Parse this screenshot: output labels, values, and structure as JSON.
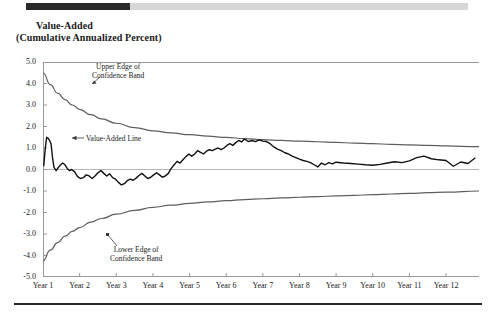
{
  "header": {
    "progress_fill_percent": 23.5,
    "bar_color": "#2b2b2b",
    "track_color": "#d7d7d7"
  },
  "title": {
    "line1": "Value-Added",
    "line2": "(Cumulative Annualized Percent)"
  },
  "annotations": {
    "upper_line1": "Upper Edge of",
    "upper_line2": "Confidence Band",
    "lower_line1": "Lower Edge of",
    "lower_line2": "Confidence Band",
    "value_line": "Value-Added Line"
  },
  "colors": {
    "value_line": "#111111",
    "band": "#5e5e5e",
    "axis": "#9a9a9a",
    "zero_line": "#b5b5b5",
    "text": "#1a1a1a"
  },
  "chart_data": {
    "type": "line",
    "title": "Value-Added (Cumulative Annualized Percent)",
    "xlabel": "",
    "ylabel": "",
    "ylim": [
      -5.0,
      5.0
    ],
    "xlim": [
      1,
      12.9
    ],
    "grid": false,
    "legend_position": "annotated-inline",
    "y_ticks": [
      "5.0",
      "4.0",
      "3.0",
      "2.0",
      "1.0",
      "0.0",
      "-1.0",
      "-2.0",
      "-3.0",
      "-4.0",
      "-5.0"
    ],
    "y_tick_values": [
      5.0,
      4.0,
      3.0,
      2.0,
      1.0,
      0.0,
      -1.0,
      -2.0,
      -3.0,
      -4.0,
      -5.0
    ],
    "x_ticks": [
      "Year 1",
      "Year 2",
      "Year 3",
      "Year 4",
      "Year 5",
      "Year 6",
      "Year 7",
      "Year 8",
      "Year 9",
      "Year 10",
      "Year 11",
      "Year 12"
    ],
    "x_tick_values": [
      1,
      2,
      3,
      4,
      5,
      6,
      7,
      8,
      9,
      10,
      11,
      12
    ],
    "series": [
      {
        "name": "Upper Edge of Confidence Band",
        "style": "smooth-decay",
        "x": [
          1.0,
          1.2,
          1.4,
          1.6,
          1.8,
          2.0,
          2.3,
          2.6,
          3.0,
          3.5,
          4.0,
          4.5,
          5.0,
          5.5,
          6.0,
          6.5,
          7.0,
          7.5,
          8.0,
          8.5,
          9.0,
          9.5,
          10.0,
          10.5,
          11.0,
          11.5,
          12.0,
          12.9
        ],
        "values": [
          4.5,
          3.95,
          3.55,
          3.25,
          3.0,
          2.8,
          2.55,
          2.35,
          2.15,
          1.95,
          1.8,
          1.7,
          1.62,
          1.55,
          1.49,
          1.44,
          1.39,
          1.35,
          1.32,
          1.29,
          1.26,
          1.23,
          1.2,
          1.17,
          1.15,
          1.12,
          1.1,
          1.06
        ]
      },
      {
        "name": "Lower Edge of Confidence Band",
        "style": "smooth-decay",
        "x": [
          1.0,
          1.2,
          1.4,
          1.6,
          1.8,
          2.0,
          2.3,
          2.6,
          3.0,
          3.5,
          4.0,
          4.5,
          5.0,
          5.5,
          6.0,
          6.5,
          7.0,
          7.5,
          8.0,
          8.5,
          9.0,
          9.5,
          10.0,
          10.5,
          11.0,
          11.5,
          12.0,
          12.9
        ],
        "values": [
          -4.25,
          -3.75,
          -3.4,
          -3.1,
          -2.88,
          -2.7,
          -2.45,
          -2.28,
          -2.08,
          -1.9,
          -1.76,
          -1.66,
          -1.58,
          -1.51,
          -1.45,
          -1.4,
          -1.36,
          -1.32,
          -1.29,
          -1.26,
          -1.23,
          -1.2,
          -1.17,
          -1.14,
          -1.11,
          -1.08,
          -1.05,
          -1.0
        ]
      },
      {
        "name": "Value-Added Line",
        "style": "jagged",
        "x": [
          1.02,
          1.06,
          1.1,
          1.14,
          1.18,
          1.22,
          1.26,
          1.3,
          1.36,
          1.42,
          1.48,
          1.54,
          1.6,
          1.66,
          1.72,
          1.78,
          1.86,
          1.94,
          2.02,
          2.1,
          2.18,
          2.26,
          2.34,
          2.42,
          2.5,
          2.58,
          2.66,
          2.74,
          2.82,
          2.9,
          2.98,
          3.06,
          3.14,
          3.22,
          3.3,
          3.38,
          3.46,
          3.54,
          3.62,
          3.7,
          3.78,
          3.86,
          3.94,
          4.02,
          4.1,
          4.18,
          4.26,
          4.34,
          4.42,
          4.5,
          4.58,
          4.66,
          4.74,
          4.82,
          4.9,
          4.98,
          5.06,
          5.14,
          5.22,
          5.3,
          5.38,
          5.46,
          5.54,
          5.62,
          5.7,
          5.78,
          5.86,
          5.94,
          6.02,
          6.1,
          6.18,
          6.26,
          6.34,
          6.42,
          6.5,
          6.6,
          6.7,
          6.8,
          6.9,
          7.0,
          7.1,
          7.2,
          7.3,
          7.4,
          7.5,
          7.6,
          7.7,
          7.8,
          7.9,
          8.0,
          8.1,
          8.2,
          8.3,
          8.4,
          8.5,
          8.6,
          8.7,
          8.8,
          8.9,
          9.0,
          9.2,
          9.4,
          9.6,
          9.8,
          10.0,
          10.2,
          10.4,
          10.6,
          10.8,
          11.0,
          11.2,
          11.4,
          11.6,
          11.8,
          12.0,
          12.2,
          12.4,
          12.6,
          12.8
        ],
        "values": [
          0.15,
          0.95,
          1.5,
          1.45,
          1.35,
          1.2,
          0.55,
          0.1,
          -0.05,
          0.1,
          0.22,
          0.3,
          0.22,
          0.05,
          -0.05,
          0.0,
          -0.1,
          -0.32,
          -0.42,
          -0.38,
          -0.25,
          -0.3,
          -0.42,
          -0.3,
          -0.15,
          -0.05,
          -0.18,
          -0.3,
          -0.2,
          -0.38,
          -0.45,
          -0.6,
          -0.72,
          -0.66,
          -0.52,
          -0.45,
          -0.5,
          -0.4,
          -0.28,
          -0.18,
          -0.3,
          -0.42,
          -0.36,
          -0.25,
          -0.15,
          -0.25,
          -0.36,
          -0.3,
          -0.18,
          0.05,
          0.22,
          0.38,
          0.3,
          0.45,
          0.6,
          0.72,
          0.62,
          0.72,
          0.88,
          0.8,
          0.72,
          0.85,
          0.92,
          0.88,
          0.95,
          1.0,
          0.92,
          1.0,
          1.12,
          1.2,
          1.12,
          1.25,
          1.35,
          1.28,
          1.42,
          1.3,
          1.35,
          1.3,
          1.38,
          1.32,
          1.3,
          1.2,
          1.05,
          0.95,
          0.88,
          0.78,
          0.72,
          0.62,
          0.55,
          0.48,
          0.42,
          0.38,
          0.32,
          0.22,
          0.12,
          0.3,
          0.22,
          0.32,
          0.26,
          0.34,
          0.3,
          0.28,
          0.25,
          0.22,
          0.2,
          0.24,
          0.3,
          0.36,
          0.32,
          0.4,
          0.55,
          0.62,
          0.5,
          0.45,
          0.42,
          0.15,
          0.35,
          0.28,
          0.55
        ]
      }
    ]
  }
}
